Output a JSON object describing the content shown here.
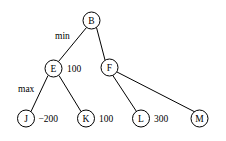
{
  "diagram": {
    "background_color": "#ffffff",
    "stroke_color": "#000000",
    "nodes": [
      {
        "id": "B",
        "label": "B",
        "cx": 91.5,
        "cy": 20.5,
        "r": 8.5
      },
      {
        "id": "E",
        "label": "E",
        "cx": 53.5,
        "cy": 68.5,
        "r": 8.5
      },
      {
        "id": "F",
        "label": "F",
        "cx": 109.5,
        "cy": 67.5,
        "r": 8.5
      },
      {
        "id": "J",
        "label": "J",
        "cx": 26.0,
        "cy": 118.5,
        "r": 8.5
      },
      {
        "id": "K",
        "label": "K",
        "cx": 86.0,
        "cy": 118.5,
        "r": 8.5
      },
      {
        "id": "L",
        "label": "L",
        "cx": 141.0,
        "cy": 118.5,
        "r": 8.5
      },
      {
        "id": "M",
        "label": "M",
        "cx": 199.5,
        "cy": 118.5,
        "r": 8.5
      }
    ],
    "edges": [
      {
        "from": "B",
        "to": "E",
        "x1": 86.5,
        "y1": 27.5,
        "x2": 58.5,
        "y2": 61.5
      },
      {
        "from": "B",
        "to": "F",
        "x1": 96.5,
        "y1": 27.5,
        "x2": 105.0,
        "y2": 60.0
      },
      {
        "from": "E",
        "to": "J",
        "x1": 48.0,
        "y1": 75.5,
        "x2": 31.0,
        "y2": 111.5
      },
      {
        "from": "E",
        "to": "K",
        "x1": 59.0,
        "y1": 75.5,
        "x2": 81.0,
        "y2": 111.5
      },
      {
        "from": "F",
        "to": "L",
        "x1": 112.5,
        "y1": 75.0,
        "x2": 136.5,
        "y2": 111.5
      },
      {
        "from": "F",
        "to": "M",
        "x1": 117.0,
        "y1": 72.0,
        "x2": 195.0,
        "y2": 112.0
      }
    ],
    "value_labels": [
      {
        "for": "E",
        "text": "100",
        "x": 67.0,
        "y": 68.5
      },
      {
        "for": "J",
        "text": "−200",
        "x": 38.5,
        "y": 118.5
      },
      {
        "for": "K",
        "text": "100",
        "x": 99.0,
        "y": 118.5
      },
      {
        "for": "L",
        "text": "300",
        "x": 154.0,
        "y": 118.5
      }
    ],
    "role_labels": [
      {
        "text": "min",
        "x": 55.0,
        "y": 36.0
      },
      {
        "text": "max",
        "x": 18.0,
        "y": 89.0
      }
    ]
  }
}
